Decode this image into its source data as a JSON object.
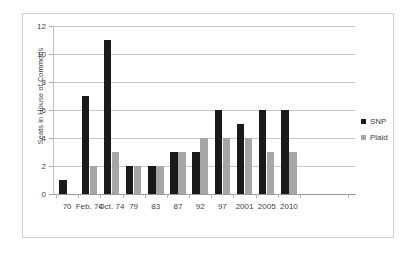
{
  "chart_data": {
    "type": "bar",
    "title": "",
    "xlabel": "",
    "ylabel": "Seats in House of Commons",
    "ylim": [
      0,
      12
    ],
    "ytick_step": 2,
    "yticks": [
      "0",
      "2",
      "4",
      "6",
      "8",
      "10",
      "12"
    ],
    "grid": true,
    "legend_position": "right",
    "categories": [
      "70",
      "Feb. 74",
      "Oct. 74",
      "79",
      "83",
      "87",
      "92",
      "97",
      "2001",
      "2005",
      "2010"
    ],
    "series": [
      {
        "name": "SNP",
        "color": "#1a1a1a",
        "values": [
          1,
          7,
          11,
          2,
          2,
          3,
          3,
          6,
          5,
          6,
          6
        ]
      },
      {
        "name": "Plaid",
        "color": "#a6a6a6",
        "values": [
          0,
          2,
          3,
          2,
          2,
          3,
          4,
          4,
          4,
          3,
          3
        ]
      }
    ]
  },
  "legend": {
    "entries": [
      {
        "label": "SNP"
      },
      {
        "label": "Plaid"
      }
    ]
  },
  "colors": {
    "snp": "#1a1a1a",
    "plaid": "#a6a6a6",
    "gridline": "#c8c8c8",
    "axis": "#9a9a9a",
    "border": "#d0d0d0",
    "text": "#3f3f3f"
  }
}
